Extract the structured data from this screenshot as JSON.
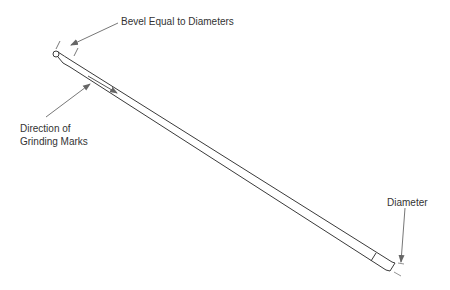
{
  "diagram": {
    "labels": {
      "bevel": "Bevel Equal to Diameters",
      "direction_line1": "Direction of",
      "direction_line2": "Grinding Marks",
      "diameter": "Diameter"
    },
    "colors": {
      "line": "#3a3a3a",
      "text": "#333333",
      "leader": "#777777",
      "background": "#ffffff"
    }
  }
}
